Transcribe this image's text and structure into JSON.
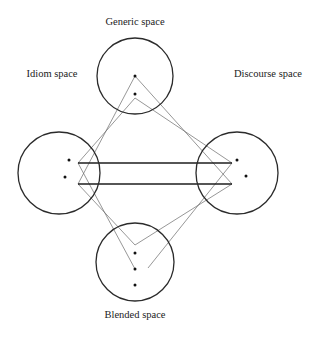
{
  "diagram": {
    "spaces": {
      "generic": {
        "label": "Generic space",
        "cx": 135,
        "cy": 76,
        "r": 38,
        "label_x": 135,
        "label_y": 25
      },
      "idiom": {
        "label": "Idiom space",
        "cx": 59,
        "cy": 173,
        "r": 41,
        "label_x": 52,
        "label_y": 77
      },
      "discourse": {
        "label": "Discourse space",
        "cx": 237,
        "cy": 173,
        "r": 41,
        "label_x": 268,
        "label_y": 77
      },
      "blended": {
        "label": "Blended space",
        "cx": 135,
        "cy": 262,
        "r": 39,
        "label_x": 135,
        "label_y": 318
      }
    },
    "dots": [
      {
        "space": "generic",
        "x": 135,
        "y": 76
      },
      {
        "space": "generic",
        "x": 135,
        "y": 94
      },
      {
        "space": "idiom",
        "x": 69,
        "y": 160
      },
      {
        "space": "idiom",
        "x": 65,
        "y": 177
      },
      {
        "space": "discourse",
        "x": 237,
        "y": 160
      },
      {
        "space": "discourse",
        "x": 246,
        "y": 176
      },
      {
        "space": "blended",
        "x": 135,
        "y": 253
      },
      {
        "space": "blended",
        "x": 135,
        "y": 269
      },
      {
        "space": "blended",
        "x": 135,
        "y": 285
      }
    ],
    "cross_space_links": [
      {
        "x1": 78,
        "y1": 163,
        "x2": 232,
        "y2": 163
      },
      {
        "x1": 78,
        "y1": 184,
        "x2": 232,
        "y2": 184
      }
    ],
    "projection_lines": [
      {
        "x1": 135,
        "y1": 76,
        "x2": 78,
        "y2": 184
      },
      {
        "x1": 135,
        "y1": 76,
        "x2": 232,
        "y2": 184
      },
      {
        "x1": 135,
        "y1": 98,
        "x2": 78,
        "y2": 163
      },
      {
        "x1": 135,
        "y1": 98,
        "x2": 232,
        "y2": 163
      },
      {
        "x1": 78,
        "y1": 163,
        "x2": 135,
        "y2": 269
      },
      {
        "x1": 232,
        "y1": 163,
        "x2": 148,
        "y2": 268
      },
      {
        "x1": 78,
        "y1": 184,
        "x2": 135,
        "y2": 245
      },
      {
        "x1": 232,
        "y1": 184,
        "x2": 135,
        "y2": 245
      }
    ]
  }
}
